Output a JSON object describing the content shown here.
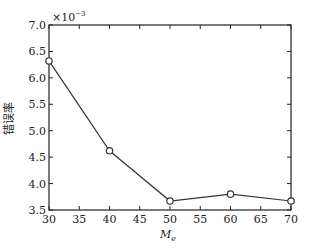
{
  "chart_data": {
    "type": "line",
    "title": "",
    "xlabel": "M_e",
    "xlabel_main": "M",
    "xlabel_sub": "e",
    "ylabel": "错误率",
    "y_multiplier": "×10⁻³",
    "y_multiplier_base": "×10",
    "y_multiplier_exp": "−3",
    "xlim": [
      30,
      70
    ],
    "ylim": [
      3.5,
      7.0
    ],
    "x_ticks": [
      30,
      35,
      40,
      45,
      50,
      55,
      60,
      65,
      70
    ],
    "x_tick_labels": [
      "30",
      "35",
      "40",
      "45",
      "50",
      "55",
      "60",
      "65",
      "70"
    ],
    "y_ticks": [
      3.5,
      4.0,
      4.5,
      5.0,
      5.5,
      6.0,
      6.5,
      7.0
    ],
    "y_tick_labels": [
      "3.5",
      "4.0",
      "4.5",
      "5.0",
      "5.5",
      "6.0",
      "6.5",
      "7.0"
    ],
    "grid": false,
    "legend": null,
    "series": [
      {
        "name": "错误率",
        "marker": "circle",
        "color": "#333333",
        "x": [
          30,
          40,
          50,
          60,
          70
        ],
        "values": [
          6.32,
          4.62,
          3.67,
          3.8,
          3.67
        ]
      }
    ]
  },
  "colors": {
    "line": "#333333",
    "axis": "#222222",
    "background": "#ffffff"
  }
}
